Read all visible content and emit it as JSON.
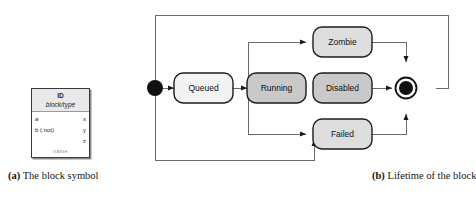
{
  "figure_a": {
    "caption_tag": "(a)",
    "caption_text": "The block symbol",
    "block": {
      "id": "ID",
      "type": "block/type",
      "ports": [
        {
          "in": "a",
          "out": "x"
        },
        {
          "in": "b (:not)",
          "out": "y"
        },
        {
          "in": "",
          "out": "z"
        }
      ],
      "footer": "name"
    }
  },
  "figure_b": {
    "caption_tag": "(b)",
    "caption_text": "Lifetime of the block",
    "states": {
      "initial": "initial-state",
      "queued": "Queued",
      "running": "Running",
      "zombie": "Zombie",
      "disabled": "Disabled",
      "failed": "Failed",
      "final": "final-state"
    },
    "colors": {
      "queued_fill": "#f2f2f2",
      "running_fill": "#c9c9c9",
      "disabled_fill": "#c9c9c9",
      "zombie_fill": "#dedede",
      "failed_fill": "#dedede",
      "stroke": "#1c1c1c",
      "line": "#5a5a5a"
    }
  }
}
